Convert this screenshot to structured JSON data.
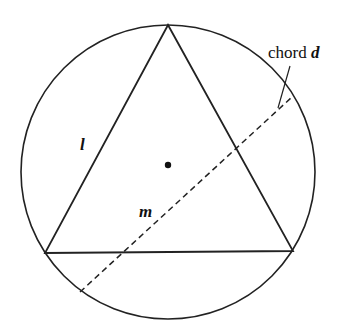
{
  "diagram": {
    "type": "geometry",
    "labels": {
      "side": "l",
      "midline": "m",
      "chord_prefix": "chord ",
      "chord_var": "d"
    },
    "colors": {
      "stroke": "#222222",
      "background": "#ffffff"
    }
  }
}
